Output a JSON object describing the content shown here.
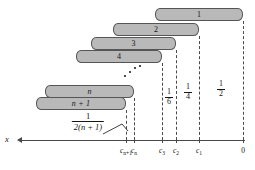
{
  "figure": {
    "axis_name": "x",
    "origin_label": "0"
  },
  "blocks": [
    {
      "label": "1",
      "x": 155,
      "y": 8,
      "w": 88,
      "h": 13
    },
    {
      "label": "2",
      "x": 113,
      "y": 23,
      "w": 86,
      "h": 13
    },
    {
      "label": "3",
      "x": 91,
      "y": 37,
      "w": 85,
      "h": 13
    },
    {
      "label": "4",
      "x": 76,
      "y": 50,
      "w": 86,
      "h": 13
    },
    {
      "label": "n",
      "x": 45,
      "y": 85,
      "w": 89,
      "h": 13
    },
    {
      "label": "n + 1",
      "x": 36,
      "y": 97,
      "w": 90,
      "h": 13
    }
  ],
  "droppers": [
    {
      "name": "dropper-cn1",
      "x": 126,
      "y": 110,
      "h": 30
    },
    {
      "name": "dropper-cn",
      "x": 134,
      "y": 98,
      "h": 42
    },
    {
      "name": "dropper-c3",
      "x": 162,
      "y": 63,
      "h": 77
    },
    {
      "name": "dropper-c2",
      "x": 176,
      "y": 50,
      "h": 90
    },
    {
      "name": "dropper-c1",
      "x": 199,
      "y": 36,
      "h": 104
    },
    {
      "name": "dropper-zero",
      "x": 243,
      "y": 21,
      "h": 119
    }
  ],
  "axis": {
    "x_start": 22,
    "x_end": 245,
    "y": 140,
    "ticks": [
      {
        "name": "tick-cn1",
        "x": 126,
        "label": "c",
        "sub": "n+1"
      },
      {
        "name": "tick-cn",
        "x": 134,
        "label": "c",
        "sub": "n"
      },
      {
        "name": "tick-c3",
        "x": 162,
        "label": "c",
        "sub": "3"
      },
      {
        "name": "tick-c2",
        "x": 176,
        "label": "c",
        "sub": "2"
      },
      {
        "name": "tick-c1",
        "x": 199,
        "label": "c",
        "sub": "1"
      },
      {
        "name": "tick-zero",
        "x": 243,
        "label": "0",
        "sub": ""
      }
    ]
  },
  "fractions": [
    {
      "name": "fraction-one-sixth",
      "num": "1",
      "den": "6",
      "x": 169,
      "y": 88
    },
    {
      "name": "fraction-one-quarter",
      "num": "1",
      "den": "4",
      "x": 188,
      "y": 83
    },
    {
      "name": "fraction-one-half",
      "num": "1",
      "den": "2",
      "x": 221,
      "y": 80
    }
  ],
  "callout": {
    "name": "fraction-one-over-two-n-plus-one",
    "num": "1",
    "den_prefix": "2(",
    "den_var": "n",
    "den_suffix": " + 1)",
    "den_full": "2(n + 1)",
    "x": 88,
    "y": 112
  },
  "ellipsis": {
    "name": "diagonal-ellipsis",
    "dots": [
      {
        "x": 0,
        "y": 10
      },
      {
        "x": 5,
        "y": 6
      },
      {
        "x": 10,
        "y": 2
      },
      {
        "x": 15,
        "y": 0
      }
    ],
    "x": 124,
    "y": 65
  },
  "colors": {
    "block_fill": "#b9b9b9",
    "block_stroke": "#555555",
    "axis": "#4a4a4a",
    "text": "#151515",
    "background": "#ffffff"
  }
}
